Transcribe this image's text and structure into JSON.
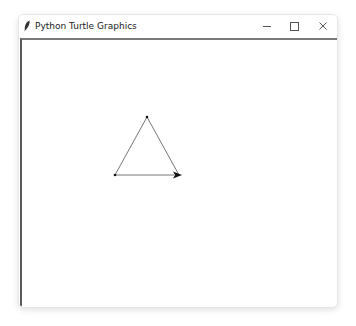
{
  "window": {
    "title": "Python Turtle Graphics",
    "icon": "feather-icon",
    "controls": {
      "minimize": "—",
      "maximize": "☐",
      "close": "✕"
    }
  },
  "canvas": {
    "background": "#ffffff",
    "shape": "triangle",
    "line_color": "#555555",
    "turtle_color": "#000000",
    "turtle_heading": "east"
  }
}
